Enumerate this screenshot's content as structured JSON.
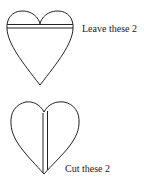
{
  "diagram": {
    "top_heart": {
      "label": "Leave these 2",
      "line_orientation": "horizontal"
    },
    "bottom_heart": {
      "label": "Cut these 2",
      "line_orientation": "vertical"
    },
    "stroke_color": "#222222"
  }
}
